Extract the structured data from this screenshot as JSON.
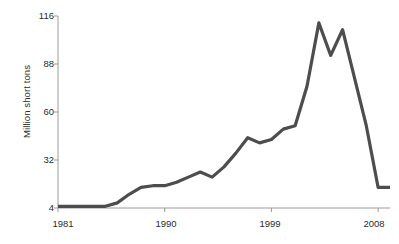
{
  "chart_data": {
    "type": "line",
    "title": "",
    "subtitle": "",
    "xlabel": "",
    "ylabel": "Million short tons",
    "xlim": [
      1981,
      2009
    ],
    "ylim": [
      4,
      116
    ],
    "yticks": [
      4,
      32,
      60,
      88,
      116
    ],
    "xticks": [
      1981,
      1990,
      1999,
      2008
    ],
    "grid": false,
    "legend": null,
    "annotations": [],
    "series": [
      {
        "name": "Million short tons",
        "color": "#4d4d4d",
        "x": [
          1981,
          1982,
          1983,
          1984,
          1985,
          1986,
          1987,
          1988,
          1989,
          1990,
          1991,
          1992,
          1993,
          1994,
          1995,
          1996,
          1997,
          1998,
          1999,
          2000,
          2001,
          2002,
          2003,
          2004,
          2005,
          2006,
          2007,
          2008,
          2009
        ],
        "values": [
          5,
          5,
          5,
          5,
          5,
          7,
          12,
          16,
          17,
          17,
          19,
          22,
          25,
          22,
          28,
          36,
          45,
          42,
          44,
          50,
          52,
          75,
          112,
          93,
          108,
          80,
          52,
          16,
          16
        ]
      }
    ]
  },
  "axes": {
    "y_tick_labels": [
      "116",
      "88",
      "60",
      "32",
      "4"
    ],
    "x_tick_labels": [
      "1981",
      "1990",
      "1999",
      "2008"
    ],
    "y_axis_title": "Million short tons"
  },
  "style": {
    "line_color": "#4d4d4d",
    "axis_color": "#9a9a9a",
    "text_color": "#2b2b2b",
    "background": "#ffffff"
  }
}
